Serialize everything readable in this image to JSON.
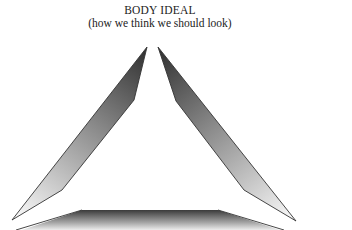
{
  "diagram": {
    "title": "BODY IDEAL",
    "subtitle": "(how we think we should look)",
    "shapes": [
      {
        "name": "left-arrow-shape",
        "kind": "tapered arrow pointing up-right"
      },
      {
        "name": "right-arrow-shape",
        "kind": "tapered arrow pointing up-left"
      },
      {
        "name": "bottom-bar-shape",
        "kind": "trapezoid base"
      }
    ],
    "colors": {
      "dark": "#3a3a3a",
      "light": "#e8e8e8",
      "outline": "#333333",
      "background": "#ffffff"
    }
  }
}
